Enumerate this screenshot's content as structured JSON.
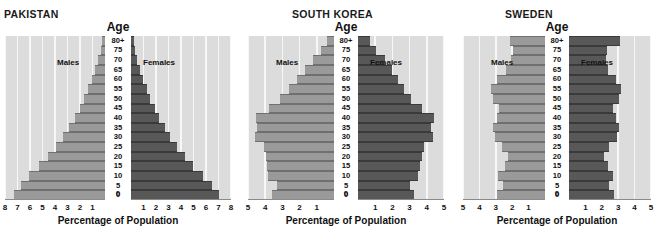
{
  "chart_data": {
    "type": "bar",
    "subtitle": "",
    "xlabel": "Percentage of Population",
    "ylabel": "Age",
    "grid": true,
    "legend_position": "inside-top",
    "orientation": "horizontal-diverging",
    "age_axis_label": "Age",
    "categories": [
      "0",
      "5",
      "10",
      "15",
      "20",
      "25",
      "30",
      "35",
      "40",
      "45",
      "50",
      "55",
      "60",
      "65",
      "70",
      "75",
      "80+"
    ],
    "series_names": [
      "Males",
      "Females"
    ],
    "panels": [
      {
        "name": "PAKISTAN",
        "xlim": [
          0,
          8
        ],
        "xticks_left": [
          "8",
          "7",
          "6",
          "5",
          "4",
          "3",
          "2",
          "1"
        ],
        "xticks_right": [
          "1",
          "2",
          "3",
          "4",
          "5",
          "6",
          "7",
          "8"
        ],
        "center_zero_label": "0",
        "males_label": "Males",
        "females_label": "Females",
        "xlabel": "Percentage of Population",
        "series": [
          {
            "name": "Males",
            "values": [
              7.3,
              6.75,
              6.05,
              5.25,
              4.55,
              3.95,
              3.35,
              2.85,
              2.4,
              2.0,
              1.65,
              1.35,
              1.05,
              0.78,
              0.55,
              0.35,
              0.22
            ]
          },
          {
            "name": "Females",
            "values": [
              7.0,
              6.45,
              5.75,
              4.95,
              4.3,
              3.7,
              3.15,
              2.7,
              2.25,
              1.88,
              1.55,
              1.25,
              0.98,
              0.72,
              0.5,
              0.32,
              0.2
            ]
          }
        ]
      },
      {
        "name": "SOUTH KOREA",
        "xlim": [
          0,
          5
        ],
        "xticks_left": [
          "5",
          "4",
          "3",
          "2",
          "1"
        ],
        "xticks_right": [
          "1",
          "2",
          "3",
          "4",
          "5"
        ],
        "center_zero_label": "0",
        "males_label": "Males",
        "females_label": "Females",
        "xlabel": "Percentage of Population",
        "series": [
          {
            "name": "Males",
            "values": [
              3.6,
              3.3,
              3.85,
              3.9,
              3.95,
              4.05,
              4.6,
              4.45,
              4.55,
              3.8,
              3.15,
              2.6,
              2.15,
              1.7,
              1.25,
              0.78,
              0.42
            ]
          },
          {
            "name": "Females",
            "values": [
              3.25,
              3.0,
              3.5,
              3.6,
              3.7,
              3.85,
              4.35,
              4.25,
              4.4,
              3.7,
              3.1,
              2.65,
              2.3,
              1.95,
              1.55,
              1.05,
              0.7
            ]
          }
        ]
      },
      {
        "name": "SWEDEN",
        "xlim": [
          0,
          5
        ],
        "xticks_left": [
          "5",
          "4",
          "3",
          "2",
          "1"
        ],
        "xticks_right": [
          "1",
          "2",
          "3",
          "4",
          "5"
        ],
        "center_zero_label": "0",
        "males_label": "Males",
        "females_label": "Females",
        "xlabel": "Percentage of Population",
        "series": [
          {
            "name": "Males",
            "values": [
              2.9,
              2.55,
              2.85,
              2.45,
              2.25,
              2.6,
              3.05,
              3.2,
              2.95,
              2.8,
              3.15,
              3.3,
              2.9,
              2.35,
              2.1,
              1.95,
              2.15
            ]
          },
          {
            "name": "Females",
            "values": [
              2.75,
              2.45,
              2.7,
              2.35,
              2.15,
              2.45,
              2.9,
              3.05,
              2.85,
              2.7,
              3.05,
              3.2,
              2.85,
              2.4,
              2.25,
              2.3,
              3.1
            ]
          }
        ]
      }
    ]
  }
}
